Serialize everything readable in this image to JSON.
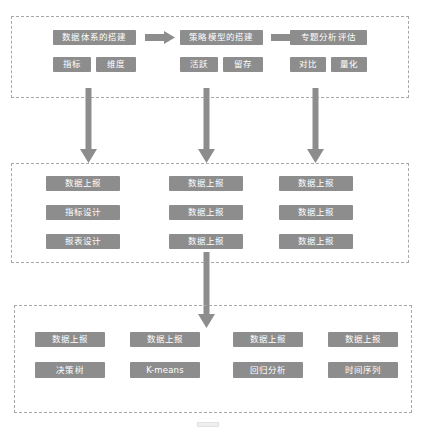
{
  "diagram": {
    "colors": {
      "box_fill": "#8d8d8d",
      "box_text": "#ffffff",
      "arrow_fill": "#8d8d8d",
      "panel_border": "#a8a8a8",
      "background": "#ffffff"
    },
    "sections": [
      {
        "id": "top",
        "name": "stage-row",
        "stages": [
          {
            "title": "数据体系的搭建",
            "subs": [
              "指标",
              "维度"
            ]
          },
          {
            "title": "策略模型的搭建",
            "subs": [
              "活跃",
              "留存"
            ]
          },
          {
            "title": "专题分析评估",
            "subs": [
              "对比",
              "量化"
            ]
          }
        ],
        "connectors": [
          "arrow-right",
          "arrow-right"
        ]
      },
      {
        "id": "middle",
        "name": "implementation-grid",
        "columns": [
          {
            "items": [
              "数据上报",
              "指标设计",
              "报表设计"
            ]
          },
          {
            "items": [
              "数据上报",
              "数据上报",
              "数据上报"
            ]
          },
          {
            "items": [
              "数据上报",
              "数据上报",
              "数据上报"
            ]
          }
        ]
      },
      {
        "id": "bottom",
        "name": "model-grid",
        "columns": [
          {
            "items": [
              "数据上报",
              "决策树"
            ]
          },
          {
            "items": [
              "数据上报",
              "K-means"
            ]
          },
          {
            "items": [
              "数据上报",
              "回归分析"
            ]
          },
          {
            "items": [
              "数据上报",
              "时间序列"
            ]
          }
        ]
      }
    ],
    "vertical_arrows": [
      {
        "name": "arrow-top-to-middle-1"
      },
      {
        "name": "arrow-top-to-middle-2"
      },
      {
        "name": "arrow-top-to-middle-3"
      },
      {
        "name": "arrow-middle-to-bottom"
      }
    ]
  }
}
